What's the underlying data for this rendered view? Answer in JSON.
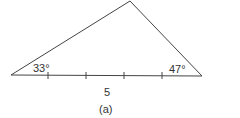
{
  "figure": {
    "caption": "(a)",
    "stroke_color": "#444444",
    "triangle": {
      "vertices": {
        "left": [
          11,
          75
        ],
        "apex": [
          130,
          1
        ],
        "right": [
          202,
          76
        ]
      },
      "angle_left": "33°",
      "angle_right": "47°",
      "base_label": "5",
      "base_tick_count": 4
    }
  }
}
